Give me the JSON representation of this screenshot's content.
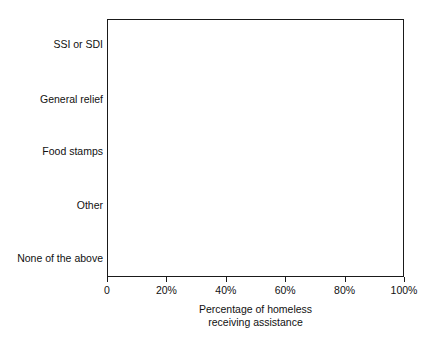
{
  "chart_data": {
    "type": "bar",
    "orientation": "horizontal",
    "title": "",
    "xlabel_line1": "Percentage of homeless",
    "xlabel_line2": "receiving assistance",
    "ylabel": "",
    "categories": [
      "SSI or SDI",
      "General relief",
      "Food stamps",
      "Other",
      "None of the above"
    ],
    "values": [
      8.5,
      22,
      40,
      6,
      47.5
    ],
    "xlim": [
      0,
      100
    ],
    "xticks": [
      0,
      20,
      40,
      60,
      80,
      100
    ],
    "xticklabels": [
      "0",
      "20%",
      "40%",
      "60%",
      "80%",
      "100%"
    ],
    "grid": false,
    "legend": false,
    "bar_color": "#050505",
    "frame_color": "#1a1a1a",
    "background": "#ffffff"
  }
}
